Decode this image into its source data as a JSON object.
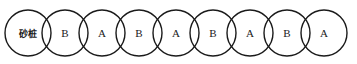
{
  "diagram": {
    "type": "overlapping-circle-row",
    "background_color": "#ffffff",
    "stroke_color": "#1a1a1a",
    "stroke_width": 1.4,
    "geometry": {
      "width": 357,
      "height": 64,
      "radius": 23,
      "center_y": 33,
      "first_center_x": 28,
      "center_spacing": 37
    },
    "circles": [
      {
        "label": "砂桩",
        "script": "cjk"
      },
      {
        "label": "B",
        "script": "latin"
      },
      {
        "label": "A",
        "script": "latin"
      },
      {
        "label": "B",
        "script": "latin"
      },
      {
        "label": "A",
        "script": "latin"
      },
      {
        "label": "B",
        "script": "latin"
      },
      {
        "label": "A",
        "script": "latin"
      },
      {
        "label": "B",
        "script": "latin"
      },
      {
        "label": "A",
        "script": "latin"
      }
    ]
  }
}
